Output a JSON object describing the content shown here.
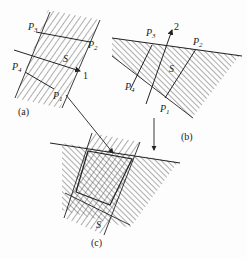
{
  "diagram": {
    "panels": [
      {
        "id": "a",
        "caption": "(a)",
        "points": {
          "P1": "P",
          "P1_sub": "1",
          "P2": "P",
          "P2_sub": "2",
          "P3": "P",
          "P3_sub": "3",
          "P4": "P",
          "P4_sub": "4"
        },
        "region_label": "S",
        "direction_label": "1",
        "hatch": "forward-diagonal"
      },
      {
        "id": "b",
        "caption": "(b)",
        "points": {
          "P1": "P",
          "P1_sub": "1",
          "P2": "P",
          "P2_sub": "2",
          "P3": "P",
          "P3_sub": "3",
          "P4": "P",
          "P4_sub": "4"
        },
        "region_label": "S",
        "direction_label": "2",
        "hatch": "back-diagonal"
      },
      {
        "id": "c",
        "caption": "(c)",
        "region_label": "S",
        "hatch": "cross-hatch intersection"
      }
    ],
    "colors": {
      "ink": "#222222",
      "background": "#fdfdfd"
    }
  }
}
